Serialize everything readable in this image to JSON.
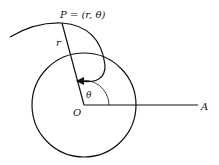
{
  "diagram": {
    "title_label": "P = (r, θ)",
    "labels": {
      "r": "r",
      "theta": "θ",
      "origin": "O",
      "axis_end": "A"
    },
    "colors": {
      "stroke": "#111111",
      "background": "#ffffff"
    }
  }
}
